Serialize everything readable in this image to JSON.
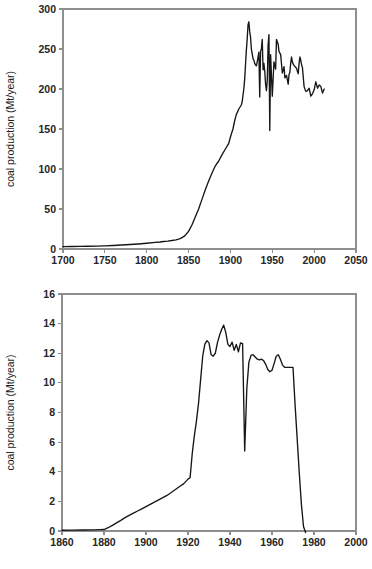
{
  "figure": {
    "background_color": "#ffffff",
    "axis_color": "#8e8e8e",
    "line_color": "#161616"
  },
  "chart_data": [
    {
      "id": "uk-coal-production-long",
      "type": "line",
      "title": "",
      "xlabel": "",
      "ylabel": "coal production (Mt/year)",
      "xlim": [
        1700,
        2050
      ],
      "ylim": [
        0,
        300
      ],
      "xticks": [
        1700,
        1750,
        1800,
        1850,
        1900,
        1950,
        2000,
        2050
      ],
      "xtick_labels": [
        "1700",
        "1750",
        "1800",
        "1850",
        "1900",
        "1950",
        "2000",
        "2050"
      ],
      "yticks": [
        0,
        50,
        100,
        150,
        200,
        250,
        300
      ],
      "ytick_labels": [
        "0",
        "50",
        "100",
        "150",
        "200",
        "250",
        "300"
      ],
      "grid": false,
      "legend": null,
      "series": [
        {
          "name": "coal production",
          "x": [
            1700,
            1710,
            1720,
            1730,
            1740,
            1750,
            1760,
            1770,
            1780,
            1790,
            1800,
            1810,
            1816,
            1820,
            1825,
            1830,
            1835,
            1840,
            1845,
            1850,
            1854,
            1858,
            1862,
            1866,
            1870,
            1874,
            1878,
            1882,
            1886,
            1890,
            1894,
            1898,
            1900,
            1903,
            1905,
            1907,
            1910,
            1913,
            1914,
            1915,
            1916,
            1917,
            1918,
            1919,
            1920,
            1921,
            1922,
            1923,
            1924,
            1925,
            1926,
            1927,
            1928,
            1929,
            1930,
            1931,
            1932,
            1933,
            1934,
            1935,
            1936,
            1937,
            1938,
            1939,
            1940,
            1941,
            1942,
            1943,
            1944,
            1945,
            1946,
            1947,
            1948,
            1950,
            1952,
            1954,
            1955,
            1957,
            1958,
            1960,
            1962,
            1964,
            1965,
            1967,
            1969,
            1970,
            1971,
            1972,
            1973,
            1974,
            1975,
            1977,
            1979,
            1980,
            1981,
            1982,
            1983,
            1984,
            1985,
            1986,
            1987,
            1988,
            1990,
            1992,
            1994,
            1996,
            1998,
            2000,
            2002,
            2004,
            2006,
            2008,
            2010,
            2012
          ],
          "y": [
            3,
            3.1,
            3.2,
            3.4,
            3.6,
            4,
            4.4,
            5,
            5.6,
            6.3,
            7.2,
            8.2,
            8.8,
            9.4,
            9.9,
            10.6,
            11.5,
            13,
            16,
            22,
            30,
            40,
            50,
            62,
            74,
            85,
            95,
            104,
            110,
            118,
            125,
            132,
            140,
            150,
            160,
            168,
            175,
            180,
            184,
            192,
            200,
            212,
            230,
            248,
            262,
            280,
            284,
            272,
            265,
            250,
            244,
            238,
            236,
            232,
            230,
            229,
            234,
            240,
            246,
            190,
            247,
            250,
            262,
            224,
            232,
            222,
            206,
            198,
            210,
            255,
            268,
            148,
            243,
            191,
            234,
            225,
            262,
            256,
            247,
            243,
            220,
            228,
            214,
            217,
            206,
            218,
            221,
            232,
            240,
            234,
            231,
            228,
            226,
            222,
            219,
            232,
            240,
            236,
            230,
            227,
            215,
            203,
            197,
            198,
            201,
            191,
            194,
            199,
            209,
            201,
            205,
            203,
            195,
            200,
            194,
            196,
            194,
            190,
            179
          ]
        }
      ],
      "notes": "Inverted-V shaped profile with 1913 peak near 287 Mt, violent swings 1920s–1940s, 1984 strike notch to ~60, collapse to 0 after 2010"
    },
    {
      "id": "uk-coal-production-regional",
      "type": "line",
      "title": "",
      "xlabel": "",
      "ylabel": "coal production (Mt/year)",
      "xlim": [
        1860,
        2000
      ],
      "ylim": [
        0,
        16
      ],
      "xticks": [
        1860,
        1880,
        1900,
        1920,
        1940,
        1960,
        1980,
        2000
      ],
      "xtick_labels": [
        "1860",
        "1880",
        "1900",
        "1920",
        "1940",
        "1960",
        "1980",
        "2000"
      ],
      "yticks": [
        0,
        2,
        4,
        6,
        8,
        10,
        12,
        14,
        16
      ],
      "ytick_labels": [
        "0",
        "2",
        "4",
        "6",
        "8",
        "10",
        "12",
        "14",
        "16"
      ],
      "grid": false,
      "legend": null,
      "series": [
        {
          "name": "coal production",
          "x": [
            1860,
            1865,
            1870,
            1875,
            1878,
            1880,
            1882,
            1884,
            1886,
            1888,
            1890,
            1892,
            1894,
            1896,
            1898,
            1900,
            1902,
            1904,
            1906,
            1908,
            1910,
            1912,
            1914,
            1916,
            1918,
            1920,
            1921,
            1922,
            1923,
            1924,
            1925,
            1926,
            1927,
            1928,
            1929,
            1930,
            1931,
            1932,
            1933,
            1934,
            1935,
            1936,
            1937,
            1938,
            1939,
            1940,
            1941,
            1942,
            1943,
            1944,
            1945,
            1946,
            1947,
            1948,
            1949,
            1950,
            1951,
            1952,
            1953,
            1954,
            1955,
            1956,
            1957,
            1958,
            1959,
            1960,
            1961,
            1962,
            1963,
            1964,
            1965,
            1966,
            1967,
            1968,
            1969,
            1970,
            1971,
            1972,
            1973,
            1974,
            1975,
            1976
          ],
          "y": [
            0.05,
            0.06,
            0.07,
            0.08,
            0.09,
            0.1,
            0.22,
            0.38,
            0.55,
            0.72,
            0.9,
            1.05,
            1.2,
            1.35,
            1.5,
            1.65,
            1.8,
            1.95,
            2.1,
            2.25,
            2.4,
            2.6,
            2.8,
            3.0,
            3.2,
            3.5,
            3.6,
            5.2,
            6.4,
            7.4,
            8.6,
            10.2,
            11.8,
            12.6,
            12.85,
            12.7,
            11.9,
            11.8,
            12.0,
            12.7,
            13.2,
            13.6,
            13.9,
            13.4,
            12.6,
            12.45,
            12.75,
            12.2,
            12.6,
            12.1,
            12.7,
            12.65,
            5.4,
            9.6,
            11.4,
            11.85,
            11.9,
            11.75,
            11.6,
            11.55,
            11.6,
            11.5,
            11.25,
            10.9,
            10.75,
            10.85,
            11.3,
            11.8,
            11.9,
            11.6,
            11.2,
            11.05,
            11.05,
            11.05,
            11.05,
            11.05,
            8.5,
            6.2,
            3.9,
            1.8,
            0.3,
            -0.1
          ]
        }
      ],
      "notes": "Slow rise from 1880, steep growth 1921–1929 to ~12.9, peak 13.9 in 1938, sharp collapse to 5.4 in 1947, plateau near 11–12 until 1970, production ends ~1975"
    }
  ]
}
